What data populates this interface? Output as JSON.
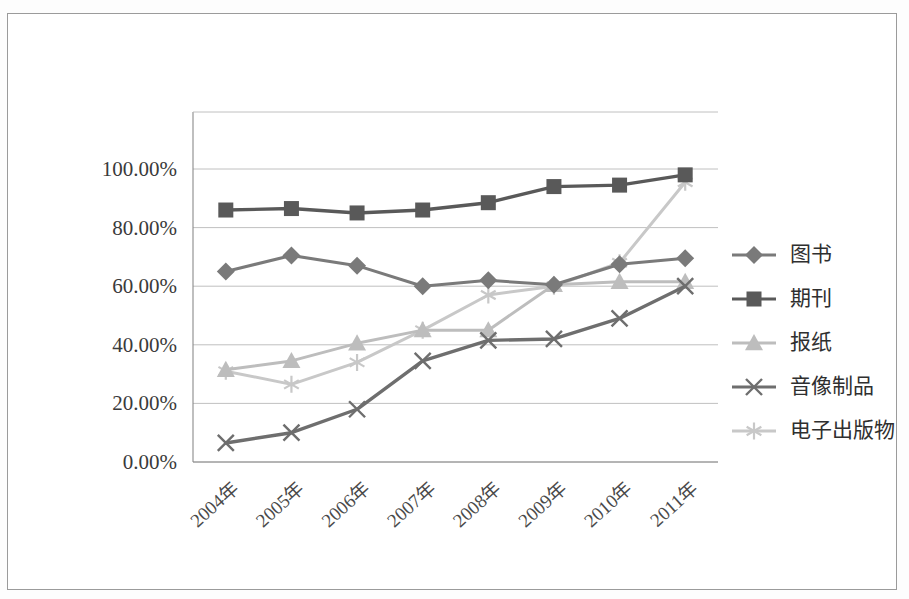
{
  "chart_data": {
    "type": "line",
    "title": "",
    "xlabel": "",
    "ylabel": "",
    "categories": [
      "2004年",
      "2005年",
      "2006年",
      "2007年",
      "2008年",
      "2009年",
      "2010年",
      "2011年"
    ],
    "ylim": [
      0,
      110
    ],
    "ytick_labels": [
      "0.00%",
      "20.00%",
      "40.00%",
      "60.00%",
      "80.00%",
      "100.00%"
    ],
    "ytick_values": [
      0,
      20,
      40,
      60,
      80,
      100
    ],
    "grid": true,
    "legend_position": "right",
    "series": [
      {
        "name": "图书",
        "marker": "diamond",
        "color": "#7a7a7a",
        "values": [
          65.0,
          70.5,
          67.0,
          60.0,
          62.0,
          60.5,
          67.5,
          69.5
        ]
      },
      {
        "name": "期刊",
        "marker": "square",
        "color": "#595959",
        "values": [
          86.0,
          86.5,
          85.0,
          86.0,
          88.5,
          94.0,
          94.5,
          98.0
        ]
      },
      {
        "name": "报纸",
        "marker": "triangle",
        "color": "#bdbdbd",
        "values": [
          31.5,
          34.5,
          40.5,
          45.0,
          45.0,
          60.5,
          61.5,
          61.5
        ]
      },
      {
        "name": "音像制品",
        "marker": "x",
        "color": "#6e6e6e",
        "values": [
          6.5,
          10.0,
          18.0,
          34.5,
          41.5,
          42.0,
          49.0,
          60.0
        ]
      },
      {
        "name": "电子出版物",
        "marker": "asterisk",
        "color": "#c8c8c8",
        "values": [
          31.0,
          26.5,
          34.0,
          45.0,
          57.0,
          60.0,
          68.0,
          95.5
        ]
      }
    ]
  },
  "legend": {
    "items": [
      {
        "label": "图书"
      },
      {
        "label": "期刊"
      },
      {
        "label": "报纸"
      },
      {
        "label": "音像制品"
      },
      {
        "label": "电子出版物"
      }
    ]
  },
  "colors": {
    "grid": "#b9b9b9",
    "axis": "#8a8a8a",
    "frame": "#9b9b9b",
    "background": "#ffffff"
  }
}
